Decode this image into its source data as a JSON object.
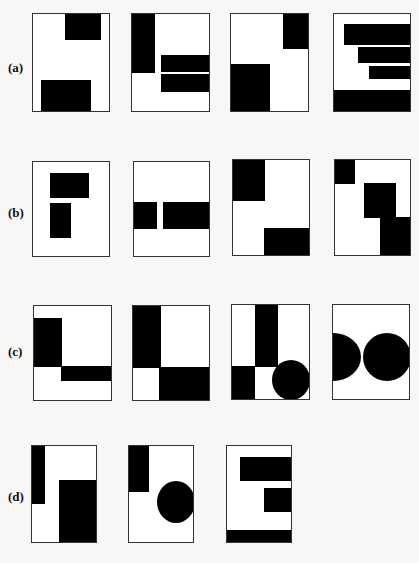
{
  "figure": {
    "rows": [
      {
        "label": "(a)",
        "label_pos": [
          8,
          60
        ],
        "frames": [
          {
            "x": 32,
            "y": 13,
            "w": 78,
            "h": 99,
            "shapes": [
              {
                "type": "rect",
                "x": 32,
                "y": 0,
                "w": 36,
                "h": 26
              },
              {
                "type": "rect",
                "x": 8,
                "y": 66,
                "w": 50,
                "h": 33
              }
            ]
          },
          {
            "x": 131,
            "y": 13,
            "w": 79,
            "h": 99,
            "shapes": [
              {
                "type": "rect",
                "x": 0,
                "y": 0,
                "w": 23,
                "h": 59
              },
              {
                "type": "rect",
                "x": 29,
                "y": 41,
                "w": 50,
                "h": 17
              },
              {
                "type": "rect",
                "x": 29,
                "y": 60,
                "w": 50,
                "h": 18
              }
            ]
          },
          {
            "x": 230,
            "y": 13,
            "w": 79,
            "h": 99,
            "shapes": [
              {
                "type": "rect",
                "x": 52,
                "y": 0,
                "w": 27,
                "h": 35
              },
              {
                "type": "rect",
                "x": 0,
                "y": 50,
                "w": 39,
                "h": 49
              }
            ]
          },
          {
            "x": 333,
            "y": 13,
            "w": 78,
            "h": 99,
            "shapes": [
              {
                "type": "rect",
                "x": 10,
                "y": 10,
                "w": 68,
                "h": 21
              },
              {
                "type": "rect",
                "x": 24,
                "y": 33,
                "w": 54,
                "h": 16
              },
              {
                "type": "rect",
                "x": 35,
                "y": 52,
                "w": 43,
                "h": 13
              },
              {
                "type": "rect",
                "x": 0,
                "y": 76,
                "w": 78,
                "h": 23
              }
            ]
          }
        ]
      },
      {
        "label": "(b)",
        "label_pos": [
          8,
          205
        ],
        "frames": [
          {
            "x": 32,
            "y": 161,
            "w": 78,
            "h": 96,
            "shapes": [
              {
                "type": "rect",
                "x": 17,
                "y": 11,
                "w": 39,
                "h": 25
              },
              {
                "type": "rect",
                "x": 17,
                "y": 41,
                "w": 21,
                "h": 35
              }
            ]
          },
          {
            "x": 133,
            "y": 161,
            "w": 77,
            "h": 96,
            "shapes": [
              {
                "type": "rect",
                "x": 0,
                "y": 40,
                "w": 23,
                "h": 27
              },
              {
                "type": "rect",
                "x": 29,
                "y": 40,
                "w": 48,
                "h": 27
              }
            ]
          },
          {
            "x": 232,
            "y": 159,
            "w": 78,
            "h": 97,
            "shapes": [
              {
                "type": "rect",
                "x": 0,
                "y": 0,
                "w": 32,
                "h": 41
              },
              {
                "type": "rect",
                "x": 31,
                "y": 68,
                "w": 47,
                "h": 29
              }
            ]
          },
          {
            "x": 334,
            "y": 159,
            "w": 77,
            "h": 97,
            "shapes": [
              {
                "type": "rect",
                "x": 0,
                "y": 0,
                "w": 20,
                "h": 24
              },
              {
                "type": "rect",
                "x": 29,
                "y": 23,
                "w": 32,
                "h": 35
              },
              {
                "type": "rect",
                "x": 45,
                "y": 57,
                "w": 32,
                "h": 40
              }
            ]
          }
        ]
      },
      {
        "label": "(c)",
        "label_pos": [
          8,
          344
        ],
        "frames": [
          {
            "x": 33,
            "y": 305,
            "w": 79,
            "h": 96,
            "shapes": [
              {
                "type": "rect",
                "x": 0,
                "y": 12,
                "w": 28,
                "h": 49
              },
              {
                "type": "rect",
                "x": 27,
                "y": 60,
                "w": 52,
                "h": 15
              }
            ]
          },
          {
            "x": 132,
            "y": 305,
            "w": 78,
            "h": 96,
            "shapes": [
              {
                "type": "rect",
                "x": 0,
                "y": 0,
                "w": 28,
                "h": 62
              },
              {
                "type": "rect",
                "x": 26,
                "y": 61,
                "w": 52,
                "h": 35
              }
            ]
          },
          {
            "x": 231,
            "y": 304,
            "w": 79,
            "h": 96,
            "shapes": [
              {
                "type": "rect",
                "x": 23,
                "y": 0,
                "w": 23,
                "h": 62
              },
              {
                "type": "rect",
                "x": 0,
                "y": 61,
                "w": 23,
                "h": 35
              },
              {
                "type": "circle",
                "x": 40,
                "y": 55,
                "w": 38,
                "h": 40
              }
            ]
          },
          {
            "x": 332,
            "y": 304,
            "w": 78,
            "h": 96,
            "shapes": [
              {
                "type": "circle",
                "x": -28,
                "y": 28,
                "w": 56,
                "h": 48
              },
              {
                "type": "circle",
                "x": 30,
                "y": 28,
                "w": 48,
                "h": 48
              }
            ]
          }
        ]
      },
      {
        "label": "(d)",
        "label_pos": [
          8,
          489
        ],
        "frames": [
          {
            "x": 31,
            "y": 445,
            "w": 66,
            "h": 98,
            "shapes": [
              {
                "type": "rect",
                "x": 0,
                "y": 0,
                "w": 13,
                "h": 58
              },
              {
                "type": "rect",
                "x": 27,
                "y": 34,
                "w": 39,
                "h": 64
              }
            ]
          },
          {
            "x": 128,
            "y": 445,
            "w": 66,
            "h": 98,
            "shapes": [
              {
                "type": "rect",
                "x": 0,
                "y": 0,
                "w": 20,
                "h": 46
              },
              {
                "type": "circle",
                "x": 28,
                "y": 35,
                "w": 38,
                "h": 42
              }
            ]
          },
          {
            "x": 226,
            "y": 445,
            "w": 66,
            "h": 98,
            "shapes": [
              {
                "type": "rect",
                "x": 13,
                "y": 11,
                "w": 53,
                "h": 24
              },
              {
                "type": "rect",
                "x": 37,
                "y": 42,
                "w": 29,
                "h": 24
              },
              {
                "type": "rect",
                "x": 0,
                "y": 84,
                "w": 66,
                "h": 14
              }
            ]
          }
        ]
      }
    ]
  }
}
